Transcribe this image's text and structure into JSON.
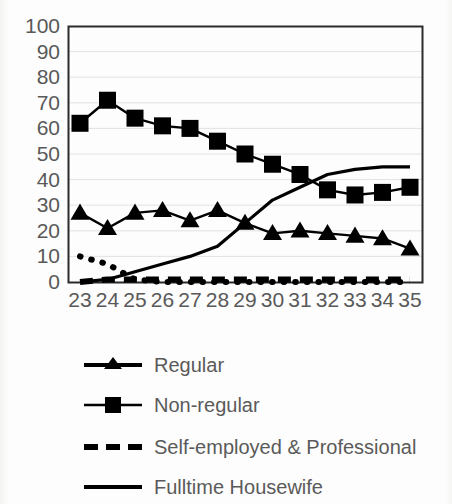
{
  "chart_data": {
    "type": "line",
    "title": "",
    "subtitle": "",
    "xlabel": "",
    "ylabel": "",
    "xlim": [
      23,
      35
    ],
    "ylim": [
      0,
      100
    ],
    "ytick_step": 10,
    "grid": true,
    "grid_axis": "y",
    "legend_position": "bottom",
    "x": [
      23,
      24,
      25,
      26,
      27,
      28,
      29,
      30,
      31,
      32,
      33,
      34,
      35
    ],
    "categories": [
      "23",
      "24",
      "25",
      "26",
      "27",
      "28",
      "29",
      "30",
      "31",
      "32",
      "33",
      "34",
      "35"
    ],
    "yticks": [
      "0",
      "10",
      "20",
      "30",
      "40",
      "50",
      "60",
      "70",
      "80",
      "90",
      "100"
    ],
    "series": [
      {
        "name": "Regular",
        "marker": "triangle",
        "line_style": "solid",
        "color": "#000000",
        "values": [
          27,
          21,
          27,
          28,
          24,
          28,
          23,
          19,
          20,
          19,
          18,
          17,
          13
        ]
      },
      {
        "name": "Non-regular",
        "marker": "square",
        "line_style": "solid",
        "color": "#000000",
        "values": [
          62,
          71,
          64,
          61,
          60,
          55,
          50,
          46,
          42,
          36,
          34,
          35,
          37
        ]
      },
      {
        "name": "Self-employed & Professional",
        "marker": "none",
        "line_style": "dashed",
        "color": "#000000",
        "values": [
          0,
          1,
          1,
          1,
          1,
          1,
          1,
          1,
          1,
          1,
          1,
          1,
          1
        ]
      },
      {
        "name": "Fulltime Housewife",
        "marker": "none",
        "line_style": "solid",
        "color": "#000000",
        "values": [
          0,
          1,
          4,
          7,
          10,
          14,
          23,
          32,
          37,
          42,
          44,
          45,
          45
        ]
      },
      {
        "name": "Student",
        "marker": "none",
        "line_style": "dotted",
        "color": "#000000",
        "values": [
          10,
          7,
          1,
          0,
          0,
          0,
          0,
          0,
          0,
          0,
          0,
          0,
          0
        ]
      }
    ]
  },
  "legend": {
    "items": [
      {
        "label": "Regular",
        "key": "line-triangle-marker"
      },
      {
        "label": "Non-regular",
        "key": "line-square-marker"
      },
      {
        "label": "Self-employed & Professional",
        "key": "dashed-line"
      },
      {
        "label": "Fulltime Housewife",
        "key": "solid-line"
      },
      {
        "label": "Student",
        "key": "dotted-line"
      }
    ]
  }
}
